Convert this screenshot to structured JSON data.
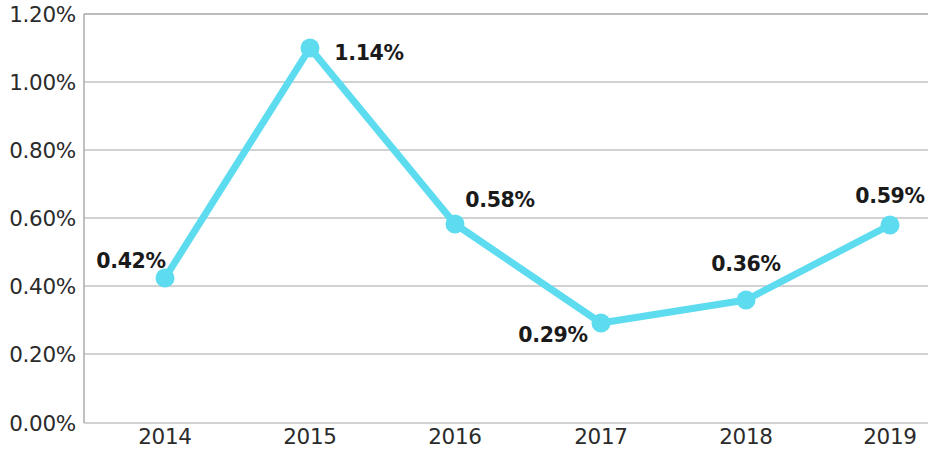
{
  "chart_data": {
    "type": "line",
    "title": "",
    "subtitle": "",
    "xlabel": "",
    "ylabel": "",
    "categories": [
      "2014",
      "2015",
      "2016",
      "2017",
      "2018",
      "2019"
    ],
    "values": [
      0.42,
      1.14,
      0.58,
      0.29,
      0.36,
      0.59
    ],
    "value_labels": [
      "0.42%",
      "1.14%",
      "0.58%",
      "0.29%",
      "0.36%",
      "0.59%"
    ],
    "ylim": [
      0.0,
      1.2
    ],
    "ytick_values": [
      0.0,
      0.2,
      0.4,
      0.6,
      0.8,
      1.0,
      1.2
    ],
    "ytick_labels": [
      "0.00%",
      "0.20%",
      "0.40%",
      "0.60%",
      "0.80%",
      "1.00%",
      "1.20%"
    ],
    "grid": true,
    "legend": false,
    "legend_position": "none",
    "series": [
      {
        "name": "",
        "values": [
          0.42,
          1.14,
          0.58,
          0.29,
          0.36,
          0.59
        ],
        "color": "#5DDCF0",
        "marker": "circle"
      }
    ],
    "colors": {
      "line": "#5DDCF0",
      "marker": "#5DDCF0",
      "grid": "#a6a6a6",
      "axis": "#a6a6a6",
      "tick_text": "#2b2b2b",
      "data_label_text": "#1a1a1a",
      "background": "#ffffff"
    }
  },
  "axes": {
    "y_ticks": [
      {
        "label": "1.20%",
        "value": 1.2,
        "y": 14
      },
      {
        "label": "1.00%",
        "value": 1.0,
        "y": 82
      },
      {
        "label": "0.80%",
        "value": 0.8,
        "y": 150
      },
      {
        "label": "0.60%",
        "value": 0.6,
        "y": 218
      },
      {
        "label": "0.40%",
        "value": 0.4,
        "y": 286
      },
      {
        "label": "0.20%",
        "value": 0.2,
        "y": 354
      },
      {
        "label": "0.00%",
        "value": 0.0,
        "y": 423
      }
    ],
    "x_ticks": [
      {
        "label": "2014",
        "x": 165
      },
      {
        "label": "2015",
        "x": 310
      },
      {
        "label": "2016",
        "x": 455
      },
      {
        "label": "2017",
        "x": 601
      },
      {
        "label": "2018",
        "x": 746
      },
      {
        "label": "2019",
        "x": 890
      }
    ]
  },
  "points": [
    {
      "category": "2014",
      "label": "0.42%",
      "value": 0.42,
      "cx": 165,
      "cy": 278,
      "lx": 131,
      "ly": 261
    },
    {
      "category": "2015",
      "label": "1.14%",
      "value": 1.14,
      "cx": 310,
      "cy": 48,
      "lx": 369,
      "ly": 53
    },
    {
      "category": "2016",
      "label": "0.58%",
      "value": 0.58,
      "cx": 455,
      "cy": 224,
      "lx": 500,
      "ly": 200
    },
    {
      "category": "2017",
      "label": "0.29%",
      "value": 0.29,
      "cx": 601,
      "cy": 323,
      "lx": 553,
      "ly": 335
    },
    {
      "category": "2018",
      "label": "0.36%",
      "value": 0.36,
      "cx": 746,
      "cy": 300,
      "lx": 746,
      "ly": 264
    },
    {
      "category": "2019",
      "label": "0.59%",
      "value": 0.59,
      "cx": 890,
      "cy": 225,
      "lx": 890,
      "ly": 196
    }
  ]
}
